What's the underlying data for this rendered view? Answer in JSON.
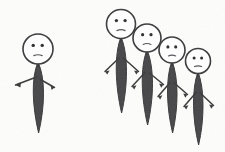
{
  "artwork": {
    "title": "Hand-drawn stick figures: one individual facing a group of four",
    "medium": "pen and ink sketch",
    "background_color": "#fdfdfc",
    "ink_color": "#3a3a3c",
    "fill_color": "#46464a",
    "head_fill_color": "#ffffff",
    "figure_count": 5
  },
  "groups": [
    {
      "id": "lone-figure-group",
      "name": "lone individual",
      "label": "Single stick figure standing apart on the left",
      "member_count": 1
    },
    {
      "id": "crowd-group",
      "name": "group of four",
      "label": "Cluster of four stick figures on the right",
      "member_count": 4
    }
  ],
  "figures": [
    {
      "id": "figure-1",
      "group": "lone-figure-group",
      "position": "left",
      "head_center_x": 38,
      "head_center_y": 49,
      "head_radius": 15,
      "body_top_y": 62,
      "body_bottom_y": 133,
      "body_half_width": 6.5,
      "arm_y": 78,
      "left_arm_end_x": 14,
      "left_arm_end_y": 85,
      "right_arm_end_x": 55,
      "right_arm_end_y": 88,
      "expression": "neutral-frown",
      "eyes": 2
    },
    {
      "id": "figure-2",
      "group": "crowd-group",
      "position": "group-first-tallest",
      "head_center_x": 121,
      "head_center_y": 24,
      "head_radius": 14.5,
      "body_top_y": 37,
      "body_bottom_y": 113,
      "body_half_width": 6.5,
      "arm_y": 58,
      "left_arm_end_x": 104,
      "left_arm_end_y": 72,
      "right_arm_end_x": 139,
      "right_arm_end_y": 72,
      "expression": "neutral-frown",
      "eyes": 2
    },
    {
      "id": "figure-3",
      "group": "crowd-group",
      "position": "group-second",
      "head_center_x": 147,
      "head_center_y": 38,
      "head_radius": 14,
      "body_top_y": 50,
      "body_bottom_y": 125,
      "body_half_width": 6.5,
      "arm_y": 73,
      "left_arm_end_x": 131,
      "left_arm_end_y": 87,
      "right_arm_end_x": 164,
      "right_arm_end_y": 85,
      "expression": "neutral-frown",
      "eyes": 2
    },
    {
      "id": "figure-4",
      "group": "crowd-group",
      "position": "group-third",
      "head_center_x": 172,
      "head_center_y": 50,
      "head_radius": 13,
      "body_top_y": 61,
      "body_bottom_y": 133,
      "body_half_width": 6,
      "arm_y": 83,
      "left_arm_end_x": 157,
      "left_arm_end_y": 97,
      "right_arm_end_x": 188,
      "right_arm_end_y": 95,
      "expression": "neutral-frown",
      "eyes": 2
    },
    {
      "id": "figure-5",
      "group": "crowd-group",
      "position": "group-fourth-shortest",
      "head_center_x": 198,
      "head_center_y": 61,
      "head_radius": 12.5,
      "body_top_y": 72,
      "body_bottom_y": 145,
      "body_half_width": 6,
      "arm_y": 93,
      "left_arm_end_x": 183,
      "left_arm_end_y": 107,
      "right_arm_end_x": 214,
      "right_arm_end_y": 106,
      "expression": "neutral-frown",
      "eyes": 2
    }
  ]
}
